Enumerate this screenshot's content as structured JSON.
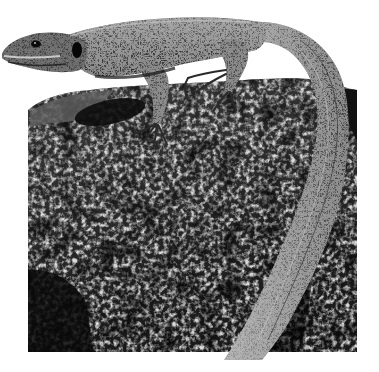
{
  "image": {
    "width": 379,
    "height": 372,
    "style": "black-and-white photograph",
    "subject": "lizard basking on a lichen-covered rock",
    "background_color": "#ffffff",
    "palette": {
      "rock_dark": "#151515",
      "rock_mid": "#4a4a4a",
      "rock_light": "#d8d8d8",
      "lizard_dark": "#1e1e1e",
      "lizard_mid": "#5a5a5a",
      "lizard_light": "#b8b8b8"
    }
  },
  "scene": {
    "rock": {
      "label": "lichen-covered rock",
      "x": 28,
      "y": 88,
      "width": 330,
      "height": 264
    },
    "lizard": {
      "label": "lizard",
      "head": {
        "x": 2,
        "y": 30
      },
      "eye": {
        "x": 36,
        "y": 44
      },
      "tail_tip": {
        "x": 225,
        "y": 352
      }
    }
  }
}
